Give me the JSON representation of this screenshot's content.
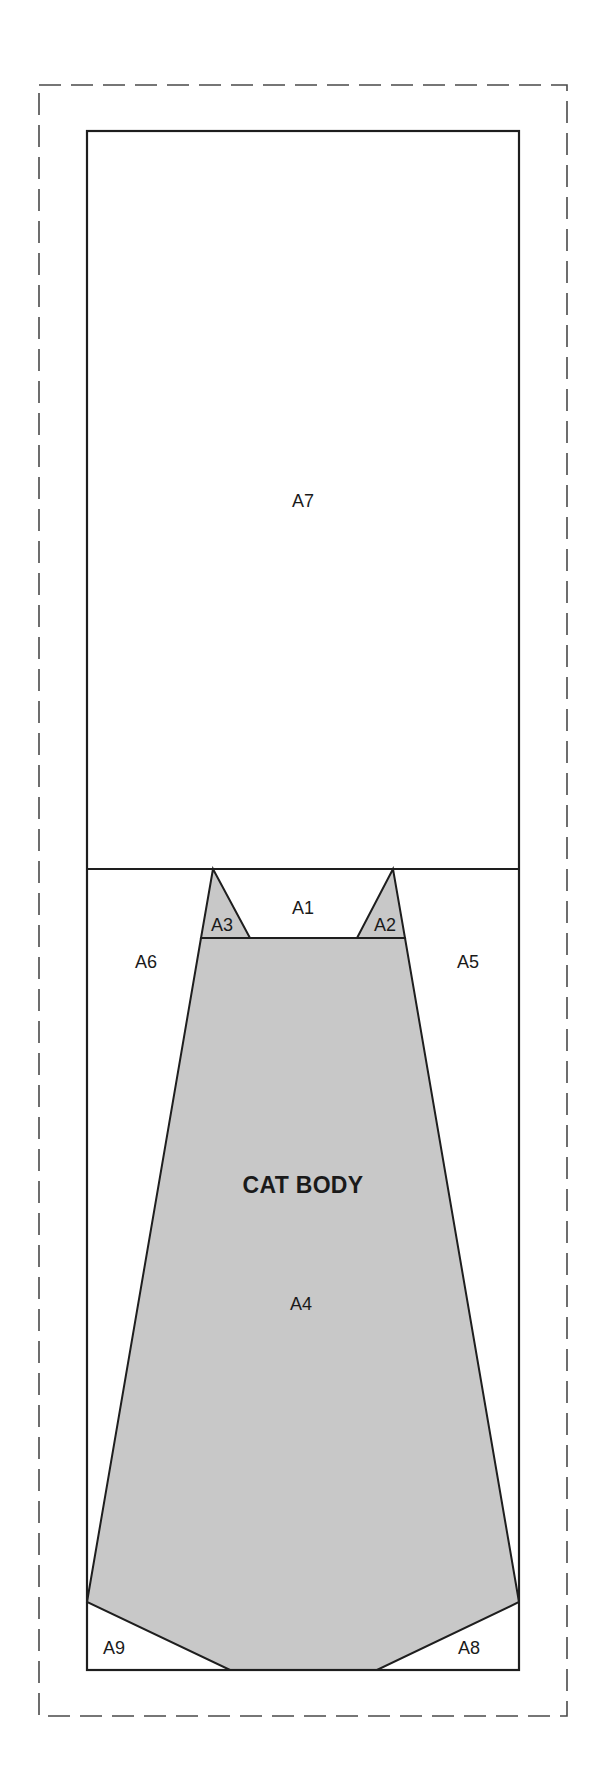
{
  "diagram": {
    "type": "quilt-block-pattern",
    "colors": {
      "background": "#ffffff",
      "body_fill": "#c8c8c8",
      "outline": "#1e1e1e",
      "seam_allowance_dash": "#4a4a4a",
      "label_text": "#1a1a1a"
    },
    "seam_allowance": {
      "x": 39,
      "y": 85,
      "width": 528,
      "height": 1631
    },
    "frame": {
      "x": 87,
      "y": 131,
      "width": 432,
      "height": 1539
    },
    "divider_y": 869,
    "title": {
      "text": "CAT BODY",
      "x": 303,
      "y": 1193
    },
    "pieces": [
      {
        "id": "A1",
        "label": "A1",
        "label_x": 303,
        "label_y": 914,
        "fill": "none"
      },
      {
        "id": "A2",
        "label": "A2",
        "label_x": 385,
        "label_y": 931,
        "fill": "gray"
      },
      {
        "id": "A3",
        "label": "A3",
        "label_x": 222,
        "label_y": 931,
        "fill": "gray"
      },
      {
        "id": "A4",
        "label": "A4",
        "label_x": 301,
        "label_y": 1310,
        "fill": "gray"
      },
      {
        "id": "A5",
        "label": "A5",
        "label_x": 468,
        "label_y": 968,
        "fill": "none"
      },
      {
        "id": "A6",
        "label": "A6",
        "label_x": 146,
        "label_y": 968,
        "fill": "none"
      },
      {
        "id": "A7",
        "label": "A7",
        "label_x": 303,
        "label_y": 507,
        "fill": "none"
      },
      {
        "id": "A8",
        "label": "A8",
        "label_x": 469,
        "label_y": 1654,
        "fill": "none"
      },
      {
        "id": "A9",
        "label": "A9",
        "label_x": 114,
        "label_y": 1654,
        "fill": "none"
      }
    ],
    "polygons": {
      "body": "201,938 87,1602 230,1670 377,1670 519,1602 405,938",
      "ear_left": "213,869 201,938 250,938",
      "ear_right": "393,869 357,938 405,938"
    },
    "lines": {
      "divider": {
        "x1": 87,
        "y1": 869,
        "x2": 519,
        "y2": 869
      },
      "shoulder": {
        "x1": 201,
        "y1": 938,
        "x2": 405,
        "y2": 938
      }
    }
  }
}
